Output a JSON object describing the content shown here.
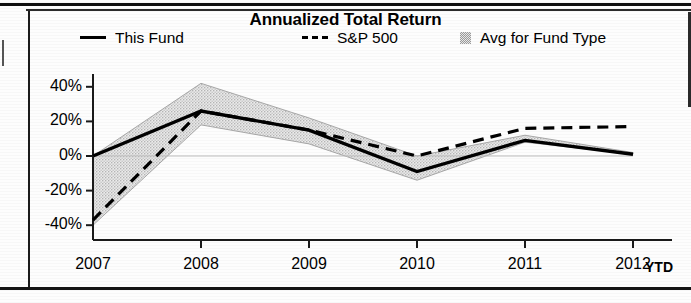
{
  "chart_title": "Annualized Total Return",
  "legend": {
    "items": [
      {
        "label": "This Fund",
        "marker": "solid-line-swatch"
      },
      {
        "label": "S&P 500",
        "marker": "dashed-line-swatch"
      },
      {
        "label": "Avg for Fund Type",
        "marker": "shaded-area-swatch"
      }
    ]
  },
  "axis": {
    "y_ticks": [
      "40%",
      "20%",
      "0%",
      "-20%",
      "-40%"
    ],
    "x_ticks": [
      "2007",
      "2008",
      "2009",
      "2010",
      "2011",
      "2012"
    ],
    "x_suffix": "YTD"
  },
  "colors": {
    "line": "#000000",
    "band_fill": "#d8d8d8",
    "band_edge": "#a8a8a8",
    "axis": "#1a1a1a",
    "page": "#ffffff"
  },
  "chart_data": {
    "type": "line",
    "title": "Annualized Total Return",
    "xlabel": "",
    "ylabel": "",
    "ylim": [
      -45,
      45
    ],
    "grid": false,
    "legend_position": "top",
    "categories": [
      "2007",
      "2008",
      "2009",
      "2010",
      "2011",
      "2012 YTD"
    ],
    "series": [
      {
        "name": "This Fund",
        "style": "solid",
        "values": [
          0,
          26,
          15,
          -9,
          9,
          1
        ]
      },
      {
        "name": "S&P 500",
        "style": "dashed",
        "values": [
          -37,
          26,
          15,
          0,
          16,
          17
        ]
      },
      {
        "name": "Avg for Fund Type",
        "style": "band",
        "upper": [
          0,
          42,
          22,
          0,
          12,
          2
        ],
        "lower": [
          -40,
          18,
          7,
          -14,
          8,
          1
        ]
      }
    ]
  }
}
